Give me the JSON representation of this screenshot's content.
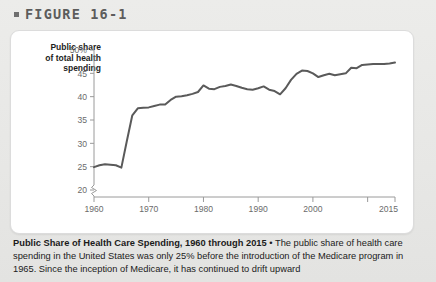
{
  "figure": {
    "bullet_icon": "square-bullet-icon",
    "label": "FIGURE 16-1"
  },
  "axis_title": {
    "line1": "Public share",
    "line2": "of total health",
    "line3": "spending"
  },
  "caption": {
    "title": "Public Share of Health Care Spending, 1960 through 2015",
    "separator": "•",
    "body": "The public share of health care spending in the United States was only 25% before the introduction of the Medicare program in 1965. Since the inception of Medicare, it has continued to drift upward"
  },
  "colors": {
    "line": "#5a5a5a",
    "axis": "#9a9a9a",
    "tick_label": "#6b6b6b",
    "card": "#ffffff",
    "page": "#e9e9e7",
    "heading": "#5c5c5c"
  },
  "chart_data": {
    "type": "line",
    "title": "Public Share of Health Care Spending, 1960 through 2015",
    "xlabel": "",
    "ylabel": "Public share of total health spending",
    "xlim": [
      1960,
      2015
    ],
    "ylim": [
      18.5,
      50
    ],
    "grid": false,
    "legend": null,
    "axis_break": true,
    "y_ticks": [
      20,
      25,
      30,
      35,
      40,
      45,
      50
    ],
    "y_tick_labels": [
      "20",
      "25",
      "30",
      "35",
      "40",
      "45",
      "50%"
    ],
    "x_ticks": [
      1960,
      1970,
      1980,
      1990,
      2000,
      2010,
      2015
    ],
    "x_tick_labels": [
      "1960",
      "1970",
      "1980",
      "1990",
      "2000",
      "",
      "2015"
    ],
    "series": [
      {
        "name": "Public share of total health spending",
        "x": [
          1960,
          1961,
          1962,
          1963,
          1964,
          1965,
          1966,
          1967,
          1968,
          1969,
          1970,
          1971,
          1972,
          1973,
          1974,
          1975,
          1976,
          1977,
          1978,
          1979,
          1980,
          1981,
          1982,
          1983,
          1984,
          1985,
          1986,
          1987,
          1988,
          1989,
          1990,
          1991,
          1992,
          1993,
          1994,
          1995,
          1996,
          1997,
          1998,
          1999,
          2000,
          2001,
          2002,
          2003,
          2004,
          2005,
          2006,
          2007,
          2008,
          2009,
          2010,
          2011,
          2012,
          2013,
          2014,
          2015
        ],
        "values": [
          24.9,
          25.3,
          25.5,
          25.4,
          25.3,
          24.8,
          30.5,
          36.0,
          37.5,
          37.6,
          37.7,
          38.0,
          38.3,
          38.3,
          39.3,
          40.0,
          40.1,
          40.3,
          40.6,
          41.0,
          42.4,
          41.7,
          41.6,
          42.1,
          42.3,
          42.6,
          42.3,
          41.9,
          41.6,
          41.5,
          41.8,
          42.2,
          41.5,
          41.2,
          40.5,
          41.8,
          43.6,
          44.9,
          45.6,
          45.5,
          45.0,
          44.2,
          44.6,
          44.9,
          44.6,
          44.8,
          45.0,
          46.2,
          46.1,
          46.8,
          46.9,
          47.0,
          47.0,
          47.0,
          47.1,
          47.3
        ]
      }
    ]
  }
}
